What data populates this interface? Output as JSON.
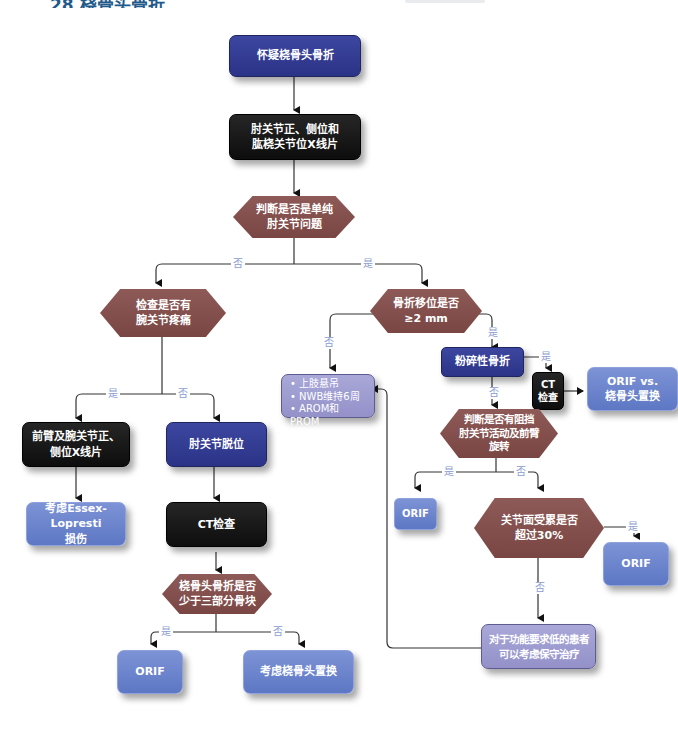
{
  "header": {
    "title": "28  桡骨头骨折"
  },
  "colors": {
    "process_navy": "#2f3890",
    "process_black": "#111111",
    "outcome_blue": "#6a83cc",
    "treatment_lavender": "#9d9cd0",
    "decision_brown": "#834f4c",
    "connector_label": "#8a9dcf"
  },
  "nodes": {
    "start": "怀疑桡骨头骨折",
    "xray_elbow": "肘关节正、侧位和\n肱桡关节位X线片",
    "q_isolated": "判断是否是单纯\n肘关节问题",
    "q_wrist_pain": "检查是否有\n腕关节疼痛",
    "xray_forearm": "前臂及腕关节正、\n侧位X线片",
    "essex": "考虑Essex-Lopresti\n损伤",
    "elbow_dislocation": "肘关节脱位",
    "ct_left": "CT检查",
    "q_three_parts": "桡骨头骨折是否\n少于三部分骨块",
    "orif_bottom_left": "ORIF",
    "replace_bottom": "考虑桡骨头置换",
    "q_displacement": "骨折移位是否\n≥2 mm",
    "conservative": {
      "items": [
        "上肢悬吊",
        "NWB维持6周",
        "AROM和PROM\n活动"
      ]
    },
    "comminuted": "粉碎性骨折",
    "ct_right": "CT\n检查",
    "orif_vs_replace": "ORIF vs.\n桡骨头置换",
    "q_block": "判断是否有阻挡\n肘关节活动及前臂\n旋转",
    "orif_mid": "ORIF",
    "q_surface": "关节面受累是否\n超过30%",
    "orif_right": "ORIF",
    "low_demand": "对于功能要求低的患者\n可以考虑保守治疗"
  },
  "edge_labels": {
    "isolated_no": "否",
    "isolated_yes": "是",
    "wrist_yes": "是",
    "wrist_no": "否",
    "disp_no": "否",
    "disp_yes": "是",
    "comminuted_yes": "是",
    "comminuted_no": "否",
    "block_yes": "是",
    "block_no": "否",
    "surface_yes": "是",
    "surface_no": "否",
    "three_yes": "是",
    "three_no": "否"
  }
}
